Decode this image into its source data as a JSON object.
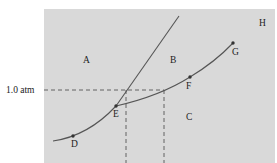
{
  "diagram": {
    "type": "phase-diagram",
    "pressure_label": "1.0 atm",
    "region_labels": {
      "A": "A",
      "B": "B",
      "C": "C",
      "H": "H"
    },
    "point_labels": {
      "D": "D",
      "E": "E",
      "F": "F",
      "G": "G"
    },
    "colors": {
      "background": "#d8d8d8",
      "line": "#555555",
      "dash": "#555555"
    }
  }
}
